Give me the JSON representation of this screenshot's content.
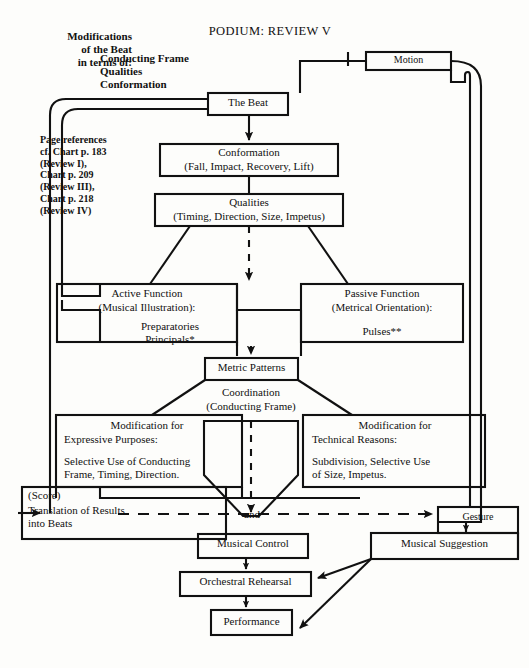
{
  "title": "PODIUM:  REVIEW  V",
  "header": {
    "modifications_note": "Modifications\nof the Beat\nin terms of:",
    "modifier_list": "Conducting Frame\nQualities\nConformation"
  },
  "page_references": "Page references\ncf. Chart p. 183\n(Review I),\nChart p. 209\n(Review III),\nChart p. 218\n(Review IV)",
  "nodes": {
    "motion": "Motion",
    "the_beat": "The Beat",
    "conformation_title": "Conformation",
    "conformation_sub": "(Fall, Impact, Recovery, Lift)",
    "qualities_title": "Qualities",
    "qualities_sub": "(Timing, Direction, Size, Impetus)",
    "active_function_title": "Active Function",
    "active_function_sub": "(Musical Illustration):",
    "active_function_items": "Preparatories\nPrincipals*",
    "passive_function_title": "Passive Function",
    "passive_function_sub": "(Metrical Orientation):",
    "passive_function_items": "Pulses**",
    "metric_patterns": "Metric Patterns",
    "coordination_title": "Coordination",
    "coordination_sub": "(Conducting Frame)",
    "mod_expressive_title": "Modification for",
    "mod_expressive_sub": "Expressive Purposes:",
    "mod_expressive_body": "Selective Use  of Conducting\nFrame, Timing,   Direction.",
    "mod_technical_title": "Modification for",
    "mod_technical_sub": "Technical Reasons:",
    "mod_technical_body": "Subdivision,  Selective Use\nof Size,  Impetus.",
    "score_label": "(Score)",
    "score_body": "Translation of Results\ninto Beats",
    "and_label": "and",
    "gesture": "Gesture",
    "musical_control": "Musical Control",
    "musical_suggestion": "Musical Suggestion",
    "orchestral_rehearsal": "Orchestral Rehearsal",
    "performance": "Performance"
  },
  "colors": {
    "ink": "#111111",
    "paper": "#fdfdfb"
  }
}
